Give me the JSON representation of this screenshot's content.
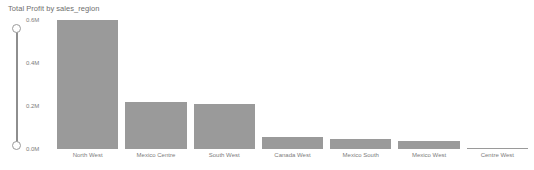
{
  "chart_data": {
    "type": "bar",
    "title": "Total Profit by sales_region",
    "xlabel": "",
    "ylabel": "",
    "categories": [
      "North West",
      "Mexico Centre",
      "South West",
      "Canada West",
      "Mexico South",
      "Mexico West",
      "Centre West"
    ],
    "values": [
      0.6,
      0.22,
      0.21,
      0.055,
      0.045,
      0.035,
      0.005
    ],
    "ylim": [
      0.0,
      0.6
    ],
    "yticks": [
      0.0,
      0.2,
      0.4,
      0.6
    ],
    "ytick_labels": [
      "0.0M",
      "0.2M",
      "0.4M",
      "0.6M"
    ],
    "grid": false,
    "legend": null,
    "bar_color": "#9a9a9a"
  },
  "axis_control": {
    "orientation": "vertical",
    "top_handle_label": "0.6M",
    "bottom_handle_label": "0.0M",
    "track_color": "#8e8e8e",
    "handle_fill": "#ffffff",
    "handle_border": "#9a9a9a"
  }
}
